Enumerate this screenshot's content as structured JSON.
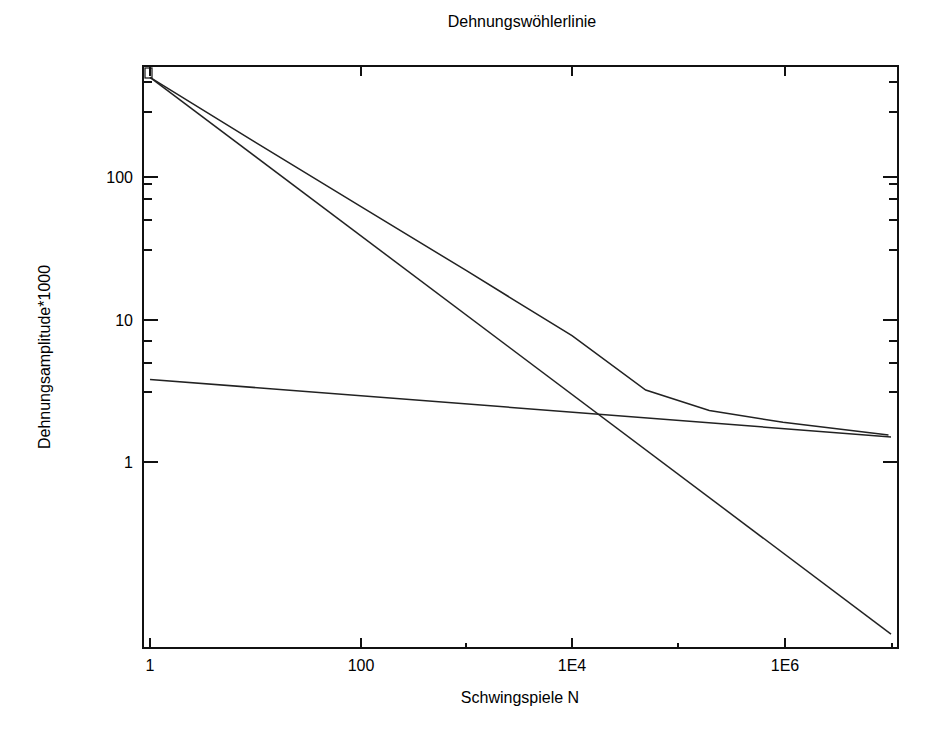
{
  "chart_data": {
    "type": "line",
    "title": "Dehnungswöhlerlinie",
    "xlabel": "Schwingspiele N",
    "ylabel": "Dehnungsamplitude*1000",
    "xscale": "log",
    "yscale": "log",
    "xlim": [
      0.9,
      12000000.0
    ],
    "ylim": [
      0.5,
      600
    ],
    "grid": false,
    "legend": null,
    "x_ticks": [
      {
        "value": 1,
        "label": "1"
      },
      {
        "value": 100,
        "label": "100"
      },
      {
        "value": 10000,
        "label": "1E4"
      },
      {
        "value": 1000000,
        "label": "1E6"
      }
    ],
    "y_ticks": [
      {
        "value": 1,
        "label": "1"
      },
      {
        "value": 10,
        "label": "10"
      },
      {
        "value": 100,
        "label": "100"
      }
    ],
    "series": [
      {
        "name": "Gesamtdehnung",
        "x": [
          1,
          10,
          100,
          1000,
          10000,
          50000,
          200000,
          1000000,
          10000000
        ],
        "y": [
          500,
          175,
          62,
          22,
          7.7,
          3.2,
          2.3,
          1.9,
          1.55
        ]
      },
      {
        "name": "Elastischer Anteil",
        "x": [
          1,
          10000000
        ],
        "y": [
          3.8,
          1.5
        ]
      },
      {
        "name": "Plastischer Anteil",
        "x": [
          1,
          10000000
        ],
        "y": [
          500,
          0.062
        ]
      }
    ]
  },
  "labels": {
    "title": "Dehnungswöhlerlinie",
    "xlabel": "Schwingspiele N",
    "ylabel": "Dehnungsamplitude*1000",
    "x_tick_1": "1",
    "x_tick_100": "100",
    "x_tick_1e4": "1E4",
    "x_tick_1e6": "1E6",
    "y_tick_1": "1",
    "y_tick_10": "10",
    "y_tick_100": "100"
  }
}
